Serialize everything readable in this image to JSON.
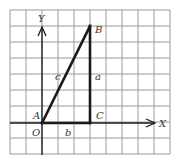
{
  "diagram": {
    "type": "right-triangle-on-grid",
    "grid": {
      "columns": 10,
      "rows": 9,
      "cell_px": 16,
      "origin_px": [
        10,
        10
      ],
      "line_color": "#9a9a9a"
    },
    "axes": {
      "x_label": "X",
      "y_label": "Y",
      "origin_label": "O"
    },
    "points": {
      "A": {
        "label": "A",
        "grid": [
          0,
          0
        ]
      },
      "B": {
        "label": "B",
        "grid": [
          3,
          6
        ]
      },
      "C": {
        "label": "C",
        "grid": [
          3,
          0
        ]
      }
    },
    "sides": {
      "a": {
        "label": "a",
        "from": "C",
        "to": "B"
      },
      "b": {
        "label": "b",
        "from": "A",
        "to": "C"
      },
      "c": {
        "label": "c",
        "from": "A",
        "to": "B"
      }
    },
    "colors": {
      "stroke": "#1a1a1a",
      "grid": "#9a9a9a",
      "text": "#333333"
    }
  }
}
